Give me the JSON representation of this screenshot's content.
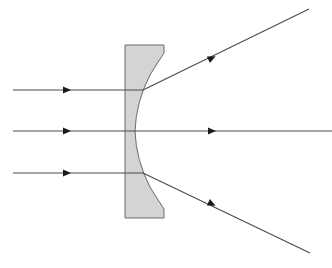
{
  "diagram": {
    "colors": {
      "background": "#ffffff",
      "lens_fill": "#d4d4d4",
      "lens_stroke": "#6a6a6a",
      "ray": "#4a4a4a",
      "arrow": "#1a1a1a"
    },
    "lens": {
      "type": "plano-concave",
      "left_x": 125,
      "right_x": 164,
      "top_y": 45,
      "bottom_y": 218,
      "vertex_x": 135,
      "vertex_y": 131
    },
    "rays": [
      {
        "name": "upper",
        "incoming_y": 90,
        "exit_point": [
          143,
          90
        ],
        "end_point": [
          309,
          9
        ],
        "behavior": "diverges upward"
      },
      {
        "name": "middle",
        "incoming_y": 131,
        "exit_point": [
          135,
          131
        ],
        "end_point": [
          332,
          131
        ],
        "behavior": "straight through"
      },
      {
        "name": "lower",
        "incoming_y": 173,
        "exit_point": [
          143,
          173
        ],
        "end_point": [
          310,
          253
        ],
        "behavior": "diverges downward"
      }
    ]
  }
}
